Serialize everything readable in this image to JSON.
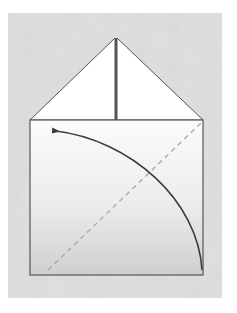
{
  "diagram": {
    "type": "origami-fold-step",
    "colors": {
      "page": "#ffffff",
      "background_paper": "#dcdcdc",
      "outline": "#555555",
      "fold_line": "#a8a8a8",
      "arrow": "#3c3c3c",
      "paper_top": "#fbfbfb",
      "paper_bottom": "#cfcfcf"
    },
    "elements": {
      "background": {
        "x": 8,
        "y": 13,
        "width": 214,
        "height": 285
      },
      "square": {
        "x": 30,
        "y": 120,
        "width": 173,
        "height": 155
      },
      "top_flap": {
        "apex": [
          115,
          38
        ],
        "left": [
          30,
          120
        ],
        "right": [
          203,
          120
        ]
      },
      "center_crease": {
        "x": 116,
        "y1": 38,
        "y2": 120
      },
      "dashed_diagonal": {
        "from": [
          48,
          270
        ],
        "to": [
          202,
          122
        ]
      },
      "fold_arrow": {
        "from": [
          202,
          270
        ],
        "to": [
          52,
          130
        ]
      }
    }
  }
}
